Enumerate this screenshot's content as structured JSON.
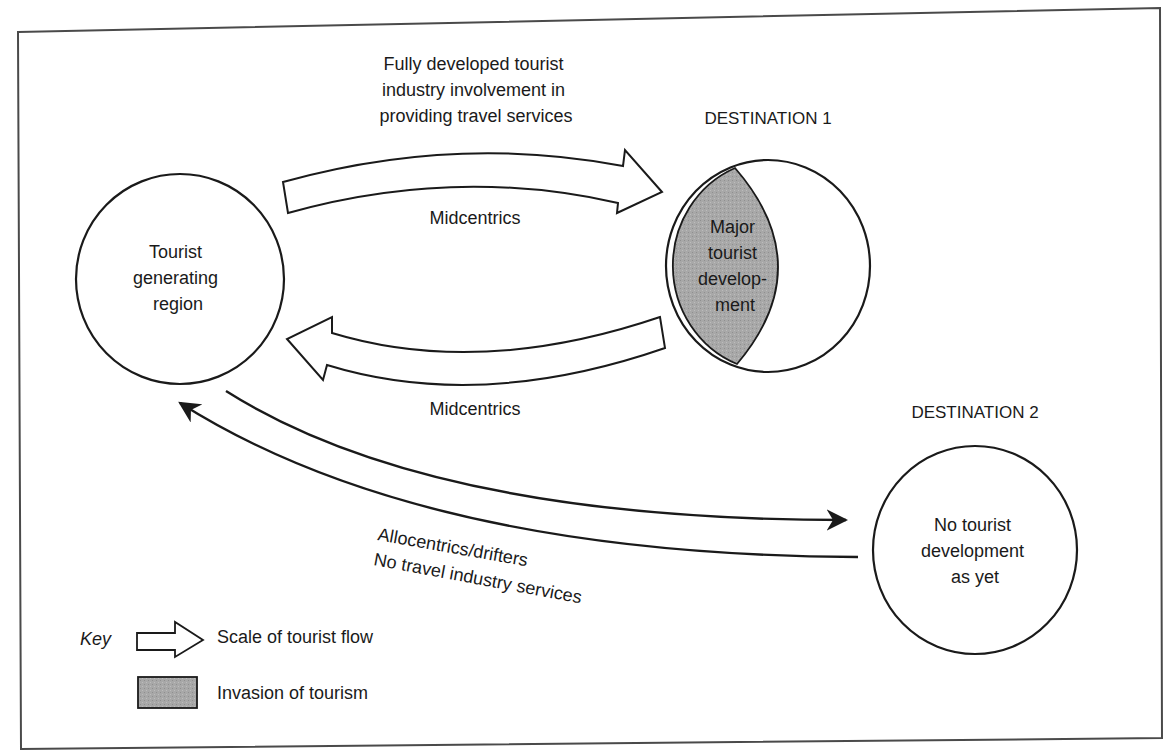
{
  "diagram": {
    "type": "tourism-flow-diagram",
    "colors": {
      "stroke": "#1a1a1a",
      "invasion_fill": "#a6a6a6",
      "background": "#ffffff"
    },
    "nodes": {
      "generating_region": {
        "label_lines": [
          "Tourist",
          "generating",
          "region"
        ]
      },
      "destination_1": {
        "title": "DESTINATION 1",
        "label_lines": [
          "Major",
          "tourist",
          "develop-",
          "ment"
        ]
      },
      "destination_2": {
        "title": "DESTINATION 2",
        "label_lines": [
          "No tourist",
          "development",
          "as yet"
        ]
      }
    },
    "flows": {
      "outbound_major": {
        "description_lines": [
          "Fully developed tourist",
          "industry involvement in",
          "providing travel services"
        ],
        "label": "Midcentrics"
      },
      "return_major": {
        "label": "Midcentrics"
      },
      "minor_flow": {
        "label_lines": [
          "Allocentrics/drifters",
          "No travel industry services"
        ]
      }
    },
    "key": {
      "title": "Key",
      "items": [
        {
          "icon": "block-arrow-icon",
          "label": "Scale of tourist flow"
        },
        {
          "icon": "gray-swatch-icon",
          "label": "Invasion of tourism"
        }
      ]
    }
  }
}
